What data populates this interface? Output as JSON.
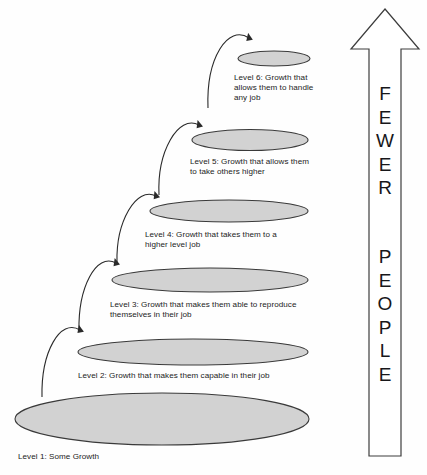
{
  "diagram": {
    "background_color": "#fefefe",
    "ellipse_fill": "#d2d2d2",
    "ellipse_stroke": "#3a3a3a",
    "levels": [
      {
        "id": "level-1",
        "label": "Level 1: Some Growth",
        "ellipse": {
          "cx": 162,
          "cy": 419,
          "rx": 147,
          "ry": 26
        },
        "label_x": 18,
        "label_y": 452
      },
      {
        "id": "level-2",
        "label": "Level 2: Growth that makes them capable in their job",
        "ellipse": {
          "cx": 193,
          "cy": 352,
          "rx": 115,
          "ry": 13
        },
        "label_x": 78,
        "label_y": 371
      },
      {
        "id": "level-3",
        "label": "Level 3: Growth that makes them able to reproduce\nthemselves in their job",
        "ellipse": {
          "cx": 210,
          "cy": 280,
          "rx": 98,
          "ry": 12
        },
        "label_x": 110,
        "label_y": 300
      },
      {
        "id": "level-4",
        "label": "Level 4: Growth that takes them to a\nhigher level job",
        "ellipse": {
          "cx": 229,
          "cy": 211,
          "rx": 79,
          "ry": 11
        },
        "label_x": 145,
        "label_y": 230
      },
      {
        "id": "level-5",
        "label": "Level 5: Growth that allows them\nto take others higher",
        "ellipse": {
          "cx": 250,
          "cy": 140,
          "rx": 58,
          "ry": 10.5
        },
        "label_x": 190,
        "label_y": 157
      },
      {
        "id": "level-6",
        "label": "Level 6: Growth that\nallows them to handle\nany job",
        "ellipse": {
          "cx": 274,
          "cy": 58.5,
          "rx": 36,
          "ry": 7.5
        },
        "label_x": 234,
        "label_y": 73
      }
    ],
    "connector_arrows": [
      {
        "id": "arrow-level1-to-level2",
        "from_level": "level-1",
        "to_level": "level-2"
      },
      {
        "id": "arrow-level2-to-level3",
        "from_level": "level-2",
        "to_level": "level-3"
      },
      {
        "id": "arrow-level3-to-level4",
        "from_level": "level-3",
        "to_level": "level-4"
      },
      {
        "id": "arrow-level4-to-level5",
        "from_level": "level-4",
        "to_level": "level-5"
      },
      {
        "id": "arrow-level5-to-level6",
        "from_level": "level-5",
        "to_level": "level-6"
      }
    ],
    "side_arrow": {
      "id": "fewer-people-arrow",
      "direction": "up",
      "stroke_color": "#3c3c3c",
      "fill_color": "#ffffff",
      "line_1": "F\nE\nW\nE\nR",
      "line_2": "P\nE\nO\nP\nL\nE",
      "line_1_text": "FEWER",
      "line_2_text": "PEOPLE"
    }
  }
}
